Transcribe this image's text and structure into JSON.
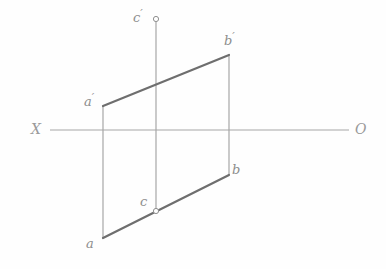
{
  "figure": {
    "type": "descriptive-geometry-projection",
    "title": "",
    "background_color": "#fefefe",
    "thick_line_color": "#6e6e6e",
    "thin_line_color": "#a6a6a6",
    "axis_line_color": "#a6a6a6",
    "label_color": "#8d8d8d"
  },
  "axis": {
    "x_label": "X",
    "o_label": "O",
    "x_label_pos": {
      "x": 31,
      "y": 122
    },
    "o_label_pos": {
      "x": 355,
      "y": 122
    },
    "line": {
      "x1": 50,
      "y1": 130,
      "x2": 349,
      "y2": 130
    }
  },
  "vertices": {
    "a_prime": {
      "label": "a",
      "prime": "′",
      "x": 103,
      "y": 106,
      "label_x": 84,
      "label_y": 92
    },
    "b_prime": {
      "label": "b",
      "prime": "′",
      "x": 229,
      "y": 55,
      "label_x": 224,
      "label_y": 31
    },
    "c_prime": {
      "label": "c",
      "prime": "′",
      "x": 156,
      "y": 19,
      "label_x": 133,
      "label_y": 8
    },
    "a": {
      "label": "a",
      "prime": "",
      "x": 103,
      "y": 238,
      "label_x": 86,
      "label_y": 237
    },
    "b": {
      "label": "b",
      "prime": "",
      "x": 229,
      "y": 175,
      "label_x": 232,
      "label_y": 163
    },
    "c": {
      "label": "c",
      "prime": "",
      "x": 156,
      "y": 211,
      "label_x": 140,
      "label_y": 195
    }
  },
  "point_markers": [
    {
      "name": "c-prime-marker",
      "x": 156,
      "y": 19,
      "r": 2.6
    },
    {
      "name": "c-marker",
      "x": 156,
      "y": 211,
      "r": 2.6
    }
  ],
  "edges": [
    {
      "name": "edge-a-prime-b-prime",
      "x1": 103,
      "y1": 106,
      "x2": 229,
      "y2": 55,
      "weight": "thick"
    },
    {
      "name": "edge-a-b",
      "x1": 103,
      "y1": 238,
      "x2": 229,
      "y2": 175,
      "weight": "thick"
    },
    {
      "name": "edge-a-prime-a",
      "x1": 103,
      "y1": 106,
      "x2": 103,
      "y2": 238,
      "weight": "thin"
    },
    {
      "name": "edge-b-prime-b",
      "x1": 229,
      "y1": 55,
      "x2": 229,
      "y2": 175,
      "weight": "thin"
    },
    {
      "name": "edge-c-prime-c",
      "x1": 156,
      "y1": 22,
      "x2": 156,
      "y2": 211,
      "weight": "thin"
    }
  ],
  "chart_data": {
    "type": "line",
    "xlabel": "X",
    "ylabel": "",
    "grid": false,
    "legend": "none",
    "labels": [
      "a′",
      "b′",
      "c′",
      "a",
      "b",
      "c",
      "X",
      "O"
    ],
    "points": [
      {
        "name": "a′",
        "x": 103,
        "y": 106
      },
      {
        "name": "b′",
        "x": 229,
        "y": 55
      },
      {
        "name": "c′",
        "x": 156,
        "y": 19
      },
      {
        "name": "a",
        "x": 103,
        "y": 238
      },
      {
        "name": "b",
        "x": 229,
        "y": 175
      },
      {
        "name": "c",
        "x": 156,
        "y": 211
      }
    ],
    "segments": [
      [
        "a′",
        "b′"
      ],
      [
        "a",
        "b"
      ],
      [
        "a′",
        "a"
      ],
      [
        "b′",
        "b"
      ],
      [
        "c′",
        "c"
      ]
    ]
  }
}
